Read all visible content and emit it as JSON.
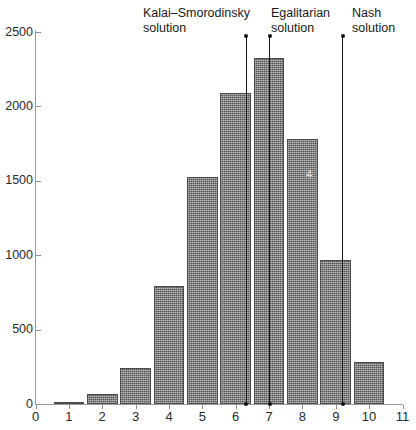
{
  "chart_data": {
    "type": "bar",
    "title": "",
    "subtitle": "",
    "xlabel": "",
    "ylabel": "",
    "categories": [
      "1",
      "2",
      "3",
      "4",
      "5",
      "6",
      "7",
      "8",
      "9",
      "10"
    ],
    "values": [
      15,
      65,
      245,
      790,
      1525,
      2090,
      2325,
      1780,
      970,
      285
    ],
    "xlim": [
      0,
      11
    ],
    "ylim": [
      0,
      2500
    ],
    "x_ticks": [
      "0",
      "1",
      "2",
      "3",
      "4",
      "5",
      "6",
      "7",
      "8",
      "9",
      "10",
      "11"
    ],
    "y_ticks": [
      "0",
      "500",
      "1000",
      "1500",
      "2000",
      "2500"
    ],
    "grid": false,
    "legend": "none",
    "bar_color": "#6e6e6e",
    "bar_edge_color": "#4b4b4b",
    "axis_color": "#9a9a9a",
    "annotations": [
      {
        "label": "Kalai–Smorodinsky\nsolution",
        "x_value": 6.3
      },
      {
        "label": "Egalitarian\nsolution",
        "x_value": 7.0
      },
      {
        "label": "Nash\nsolution",
        "x_value": 9.2
      }
    ]
  },
  "annotation_labels": {
    "kalai": "Kalai–Smorodinsky\nsolution",
    "egalitarian": "Egalitarian\nsolution",
    "nash": "Nash\nsolution"
  },
  "watermark": {
    "text": "4"
  }
}
